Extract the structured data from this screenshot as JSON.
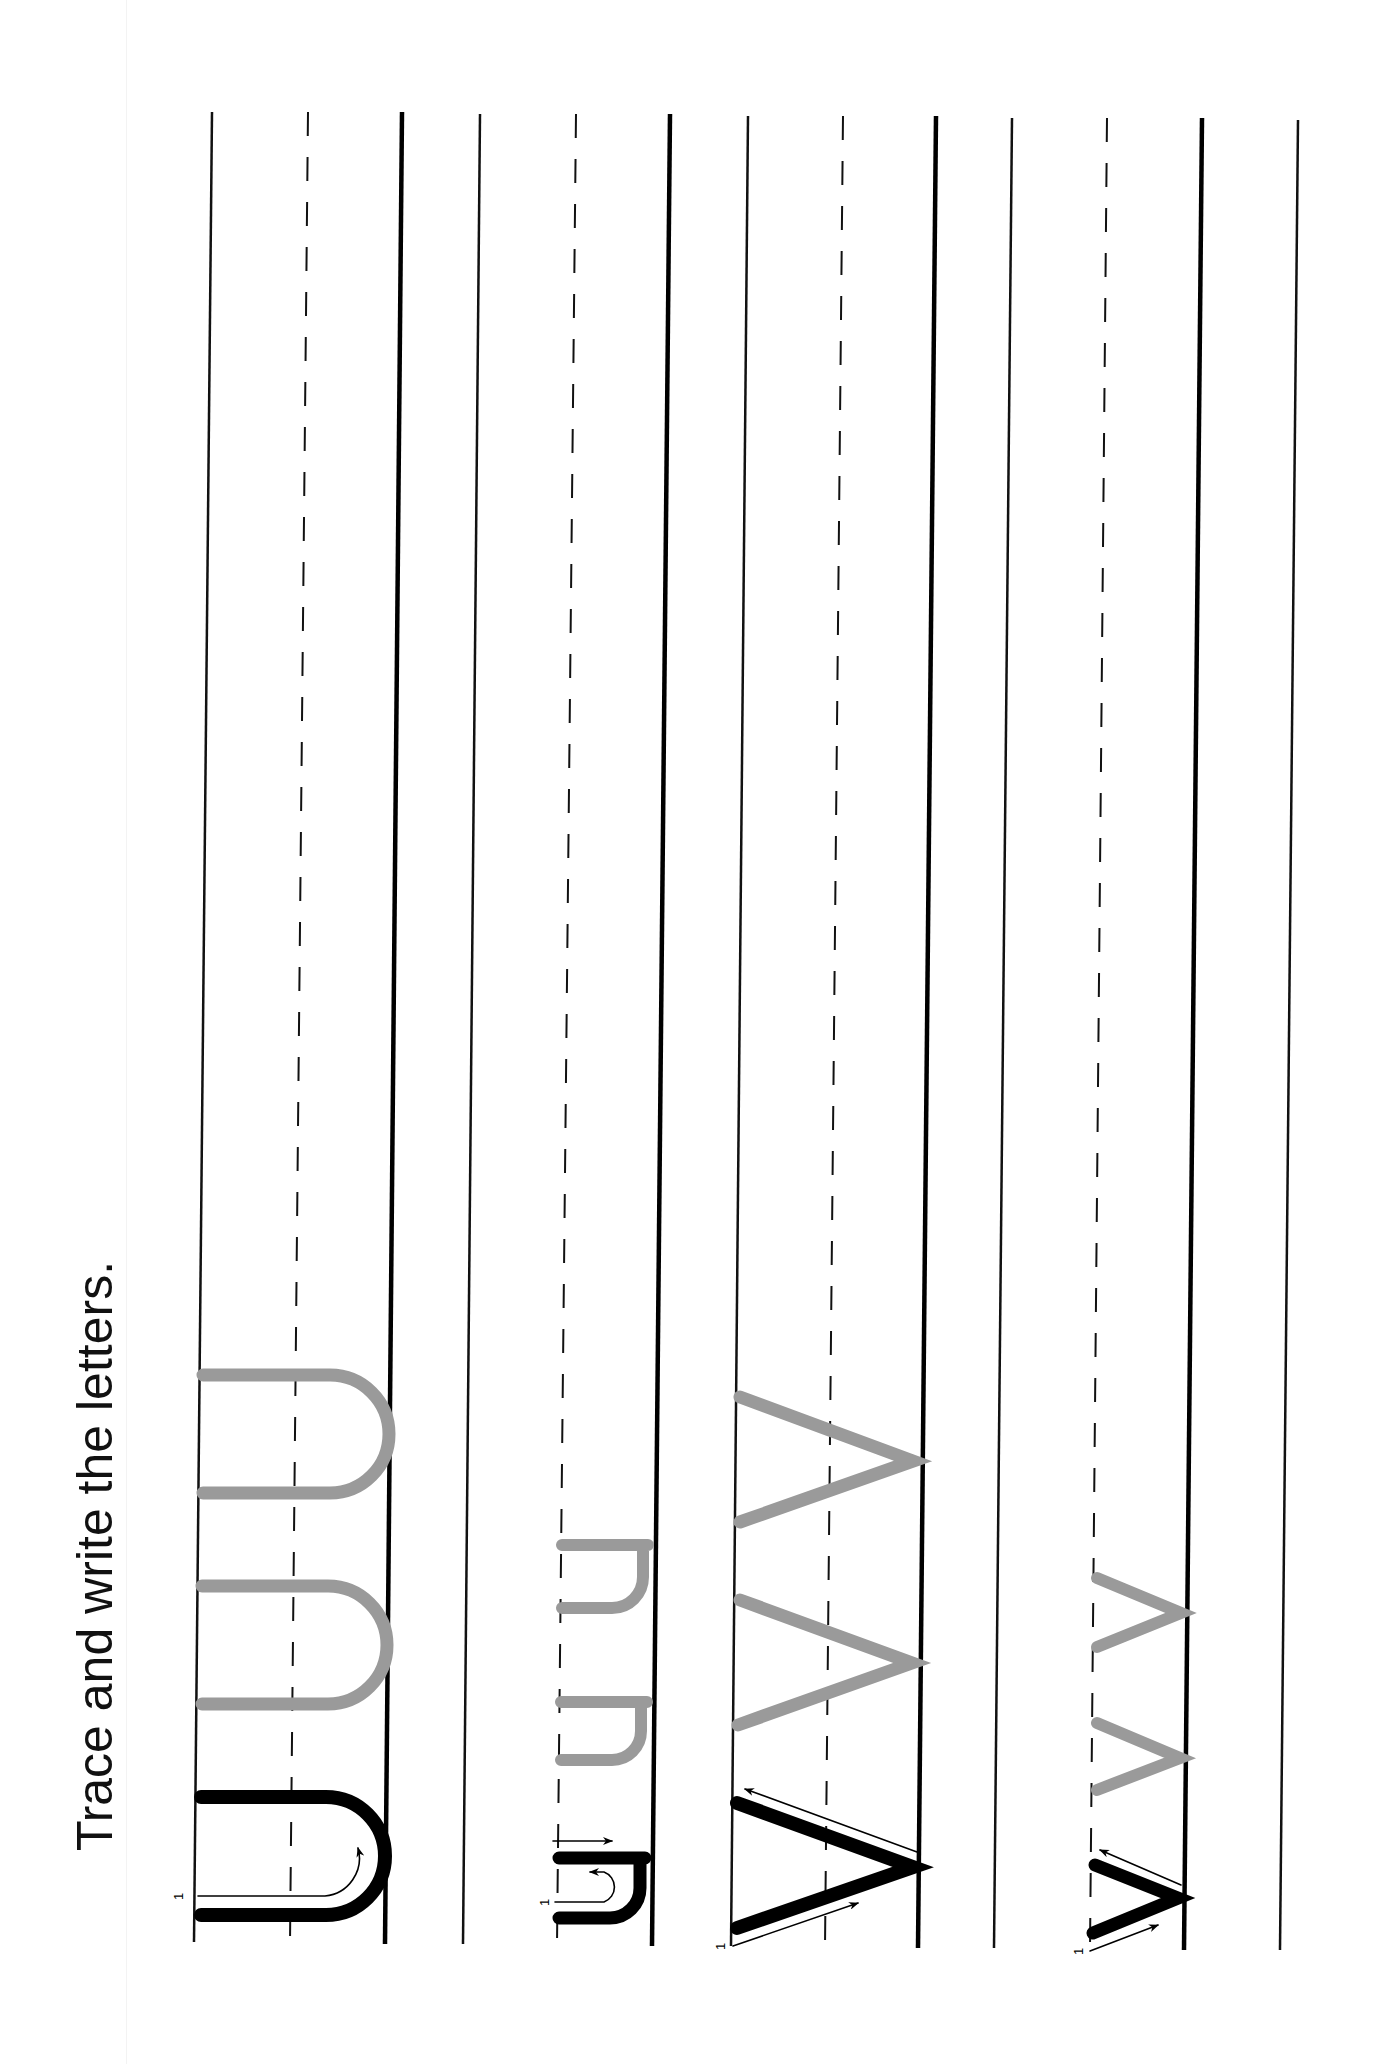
{
  "worksheet": {
    "instruction": "Trace and write the letters.",
    "colors": {
      "line": "#111111",
      "model_letter": "#000000",
      "trace_letter": "#9a9a9a",
      "background": "#ffffff"
    },
    "rows": [
      {
        "letter": "U",
        "case": "uppercase",
        "models": 1,
        "trace_copies": 2,
        "stroke_start_label": "1"
      },
      {
        "letter": "u",
        "case": "lowercase",
        "models": 1,
        "trace_copies": 2,
        "stroke_start_label": "1"
      },
      {
        "letter": "V",
        "case": "uppercase",
        "models": 1,
        "trace_copies": 2,
        "stroke_start_label": "1"
      },
      {
        "letter": "v",
        "case": "lowercase",
        "models": 1,
        "trace_copies": 2,
        "stroke_start_label": "1"
      }
    ]
  }
}
